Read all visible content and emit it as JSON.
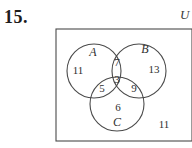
{
  "problem": {
    "number": "15."
  },
  "diagram": {
    "universe_label": "U",
    "sets": [
      {
        "name": "set-a",
        "label": "A",
        "cx": 94,
        "cy": 71,
        "r": 27,
        "label_x": 93,
        "label_y": 52
      },
      {
        "name": "set-b",
        "label": "B",
        "cx": 139,
        "cy": 71,
        "r": 27,
        "label_x": 145,
        "label_y": 49
      },
      {
        "name": "set-c",
        "label": "C",
        "cx": 117,
        "cy": 104,
        "r": 27,
        "label_x": 117,
        "label_y": 122
      }
    ],
    "rectangle": {
      "x": 56,
      "y": 29,
      "width": 136,
      "height": 112
    },
    "regions": [
      {
        "name": "region-a-only",
        "value": "11",
        "x": 78,
        "y": 70
      },
      {
        "name": "region-a-and-b",
        "value": "7",
        "x": 117,
        "y": 62
      },
      {
        "name": "region-b-only",
        "value": "13",
        "x": 154,
        "y": 69
      },
      {
        "name": "region-a-b-c",
        "value": "3",
        "x": 117,
        "y": 79
      },
      {
        "name": "region-a-and-c",
        "value": "5",
        "x": 102,
        "y": 88
      },
      {
        "name": "region-b-and-c",
        "value": "9",
        "x": 134,
        "y": 88
      },
      {
        "name": "region-c-only",
        "value": "6",
        "x": 118,
        "y": 107
      },
      {
        "name": "region-outside-sets",
        "value": "11",
        "x": 164,
        "y": 124
      }
    ],
    "colors": {
      "stroke": "#4a4a4a",
      "text": "#2f2f2f",
      "background": "#ffffff"
    }
  }
}
